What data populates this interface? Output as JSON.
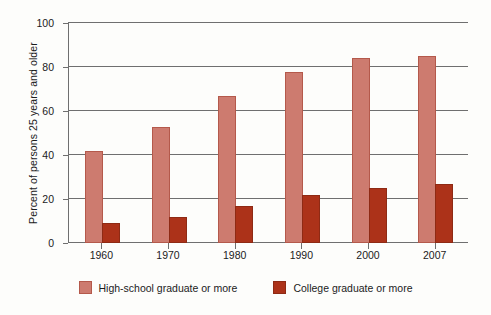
{
  "chart_data": {
    "type": "bar",
    "title": "",
    "subtitle": "",
    "xlabel": "",
    "ylabel": "Percent of persons 25 years and older",
    "categories": [
      "1960",
      "1970",
      "1980",
      "1990",
      "2000",
      "2007"
    ],
    "series": [
      {
        "name": "High-school graduate or more",
        "color": "#cd7b6f",
        "values": [
          41,
          52,
          66,
          77,
          83,
          84
        ]
      },
      {
        "name": "College graduate or more",
        "color": "#ac3219",
        "values": [
          8,
          11,
          16,
          21,
          24,
          26
        ]
      }
    ],
    "ylim": [
      0,
      100
    ],
    "yticks": [
      0,
      20,
      40,
      60,
      80,
      100
    ],
    "ytick_labels": [
      "0",
      "20",
      "40",
      "60",
      "80",
      "100"
    ],
    "grid": true,
    "grid_axis": "y",
    "legend_position": "bottom-center"
  }
}
